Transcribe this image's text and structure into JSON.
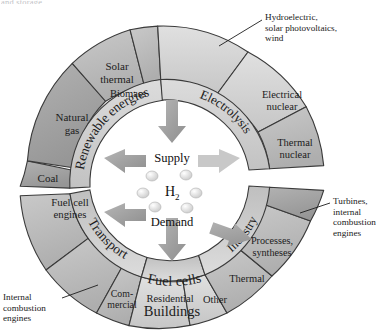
{
  "figure": {
    "clipped_top_text": "and storage.",
    "center": {
      "supply_label": "Supply",
      "demand_label": "Demand",
      "molecule_label": "H",
      "molecule_subscript": "2",
      "molecule_dot_count": 6
    },
    "colors": {
      "ring_light": "#d5d5d5",
      "ring_mid": "#b9b9b9",
      "ring_dark": "#a0a0a0",
      "ring_darkest": "#8f8f8f",
      "inner_band": "#cfcfcf",
      "stroke": "#3a3a3a",
      "arrow": "#9a9a9a",
      "arrow_light": "#c6c6c6",
      "text": "#1c1c1c",
      "background": "#ffffff"
    }
  },
  "supply": {
    "group_labels": [
      {
        "name": "renewable-energies",
        "text": "Renewable energies"
      },
      {
        "name": "electrolysis",
        "text": "Electrolysis"
      }
    ],
    "segments": [
      {
        "name": "coal",
        "text": "Coal"
      },
      {
        "name": "natural-gas",
        "text": "Natural\ngas"
      },
      {
        "name": "solar-thermal",
        "text": "Solar\nthermal"
      },
      {
        "name": "biomass",
        "text": "Biomass"
      },
      {
        "name": "renewable-electric",
        "text": ""
      },
      {
        "name": "electrical-nuclear",
        "text": "Electrical\nnuclear"
      },
      {
        "name": "thermal-nuclear",
        "text": "Thermal\nnuclear"
      }
    ]
  },
  "demand": {
    "group_labels": [
      {
        "name": "transport",
        "text": "Transport"
      },
      {
        "name": "fuel-cells",
        "text": "Fuel cells"
      },
      {
        "name": "buildings",
        "text": "Buildings"
      },
      {
        "name": "industry",
        "text": "Industry"
      }
    ],
    "segments": [
      {
        "name": "fuel-cell-engines",
        "text": "Fuel cell\nengines"
      },
      {
        "name": "transport-other",
        "text": ""
      },
      {
        "name": "commercial",
        "text": "Com-\nmercial"
      },
      {
        "name": "residential",
        "text": "Residential"
      },
      {
        "name": "other",
        "text": "Other"
      },
      {
        "name": "thermal",
        "text": "Thermal"
      },
      {
        "name": "processes-syntheses",
        "text": "Processes,\nsyntheses"
      },
      {
        "name": "industry-top",
        "text": ""
      }
    ]
  },
  "callouts": [
    {
      "name": "hydroelectric-callout",
      "text": "Hydroelectric,\nsolar photovoltaics,\nwind"
    },
    {
      "name": "turbines-callout",
      "text": "Turbines,\ninternal\ncombustion\nengines"
    },
    {
      "name": "internal-combustion-callout",
      "text": "Internal\ncombustion\nengines"
    }
  ]
}
